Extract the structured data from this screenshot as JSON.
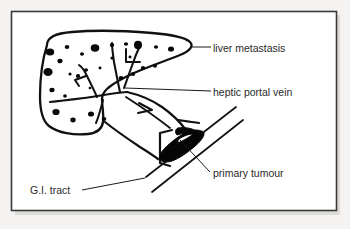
{
  "figure": {
    "kind": "medical-illustration",
    "background_color": "#f5f3f1",
    "frame_color": "#3a3a3a",
    "ink_color": "#111111",
    "text_color": "#2a2a2a",
    "width": 350,
    "height": 229
  },
  "labels": [
    {
      "id": "liver-metastasis",
      "text": "liver metastasis",
      "x": 213,
      "y": 52,
      "leader": "M 190 47 L 211 47"
    },
    {
      "id": "heptic-portal-vein",
      "text": "heptic portal vein",
      "x": 213,
      "y": 96,
      "leader": "M 125 88 L 211 91"
    },
    {
      "id": "primary-tumour",
      "text": "primary tumour",
      "x": 213,
      "y": 177,
      "leader": "M 180 140 L 210 172"
    },
    {
      "id": "gi-tract",
      "text": "G.I. tract",
      "x": 30,
      "y": 194,
      "leader": "M 82 190 L 145 178"
    }
  ],
  "structures": [
    {
      "id": "liver-outline",
      "name": "liver"
    },
    {
      "id": "portal-vein-branches",
      "name": "hepatic portal vein"
    },
    {
      "id": "gi-tube",
      "name": "G.I. tract tube"
    },
    {
      "id": "tumour-mass",
      "name": "primary tumour"
    },
    {
      "id": "metastatic-spots",
      "name": "metastatic deposits",
      "count": 28
    }
  ],
  "metastatic_spots": [
    {
      "cx": 50,
      "cy": 52,
      "rx": 4.2,
      "ry": 3.6
    },
    {
      "cx": 67,
      "cy": 47,
      "rx": 2.3,
      "ry": 2.0
    },
    {
      "cx": 82,
      "cy": 54,
      "rx": 2.0,
      "ry": 1.7
    },
    {
      "cx": 60,
      "cy": 61,
      "rx": 2.6,
      "ry": 2.3
    },
    {
      "cx": 95,
      "cy": 48,
      "rx": 4.3,
      "ry": 3.7
    },
    {
      "cx": 112,
      "cy": 45,
      "rx": 2.2,
      "ry": 1.9
    },
    {
      "cx": 126,
      "cy": 44,
      "rx": 2.1,
      "ry": 1.8
    },
    {
      "cx": 138,
      "cy": 45,
      "rx": 4.0,
      "ry": 4.2
    },
    {
      "cx": 156,
      "cy": 47,
      "rx": 2.1,
      "ry": 1.8
    },
    {
      "cx": 171,
      "cy": 49,
      "rx": 3.0,
      "ry": 2.6
    },
    {
      "cx": 48,
      "cy": 72,
      "rx": 4.6,
      "ry": 4.0
    },
    {
      "cx": 70,
      "cy": 74,
      "rx": 1.6,
      "ry": 1.5
    },
    {
      "cx": 86,
      "cy": 70,
      "rx": 2.0,
      "ry": 1.8
    },
    {
      "cx": 100,
      "cy": 68,
      "rx": 1.5,
      "ry": 1.4
    },
    {
      "cx": 78,
      "cy": 76,
      "rx": 2.2,
      "ry": 2.0
    },
    {
      "cx": 143,
      "cy": 68,
      "rx": 2.2,
      "ry": 1.9
    },
    {
      "cx": 155,
      "cy": 66,
      "rx": 2.0,
      "ry": 1.8
    },
    {
      "cx": 133,
      "cy": 74,
      "rx": 2.1,
      "ry": 1.9
    },
    {
      "cx": 121,
      "cy": 78,
      "rx": 2.4,
      "ry": 2.1
    },
    {
      "cx": 52,
      "cy": 90,
      "rx": 2.6,
      "ry": 2.3
    },
    {
      "cx": 65,
      "cy": 96,
      "rx": 1.9,
      "ry": 1.7
    },
    {
      "cx": 56,
      "cy": 112,
      "rx": 3.6,
      "ry": 3.1
    },
    {
      "cx": 73,
      "cy": 120,
      "rx": 2.7,
      "ry": 2.4
    },
    {
      "cx": 91,
      "cy": 114,
      "rx": 3.0,
      "ry": 2.6
    },
    {
      "cx": 104,
      "cy": 119,
      "rx": 2.3,
      "ry": 2.0
    },
    {
      "cx": 112,
      "cy": 58,
      "rx": 1.6,
      "ry": 1.5
    },
    {
      "cx": 90,
      "cy": 88,
      "rx": 1.4,
      "ry": 1.3
    },
    {
      "cx": 130,
      "cy": 57,
      "rx": 1.5,
      "ry": 1.4
    }
  ]
}
